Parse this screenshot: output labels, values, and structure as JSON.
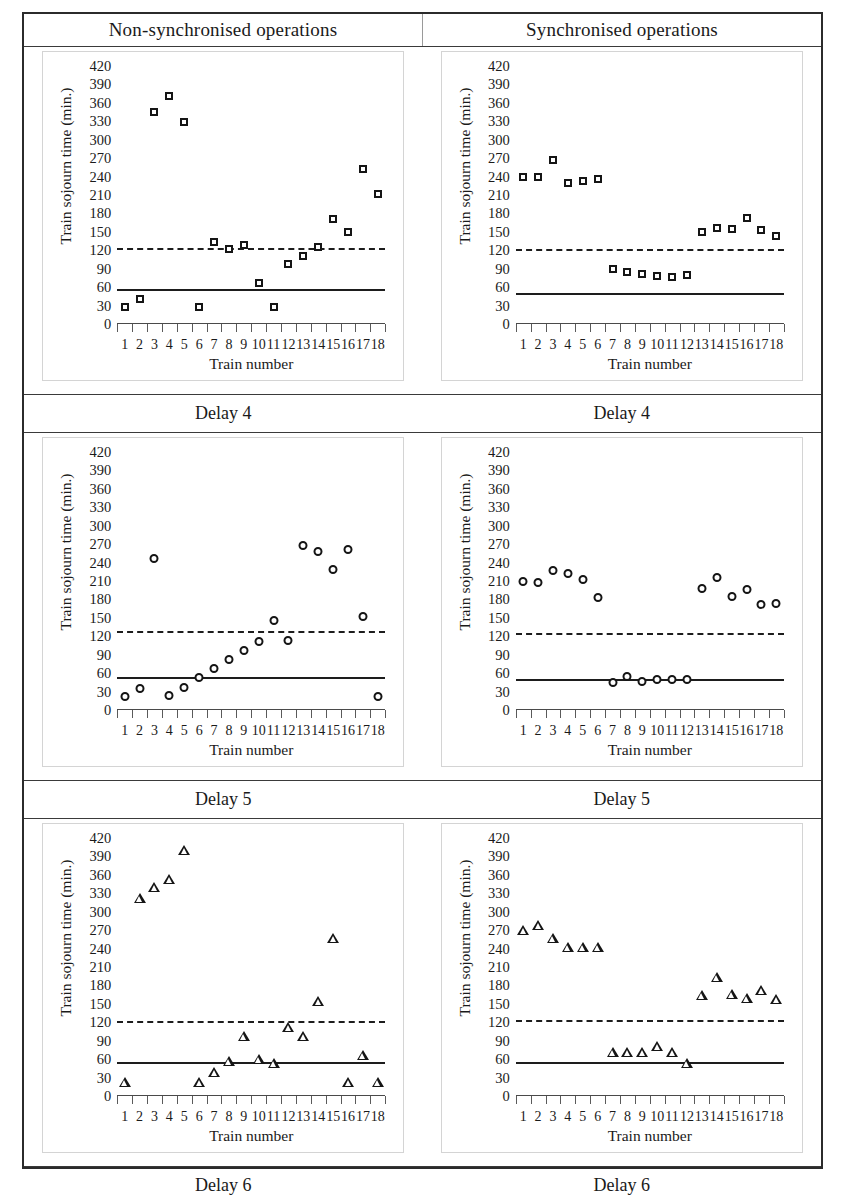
{
  "figure": {
    "column_headers": [
      "Non-synchronised operations",
      "Synchronised operations"
    ],
    "captions": [
      "Delay 4",
      "Delay 5",
      "Delay 6"
    ],
    "axis": {
      "ylabel": "Train sojourn time (min.)",
      "xlabel": "Train number",
      "yticks": [
        420,
        390,
        360,
        330,
        300,
        270,
        240,
        210,
        180,
        150,
        120,
        90,
        60,
        30,
        0
      ],
      "xticks": [
        1,
        2,
        3,
        4,
        5,
        6,
        7,
        8,
        9,
        10,
        11,
        12,
        13,
        14,
        15,
        16,
        17,
        18
      ]
    },
    "colors": {
      "marker_stroke": "#151515",
      "reference_line": "#1d1d1d",
      "axis": "#4a4a4a",
      "table_border": "#2b2b2b",
      "plot_border": "#d4d4d4"
    }
  },
  "chart_data": [
    {
      "type": "scatter",
      "id": "delay4-nonsync",
      "title": "Delay 4",
      "panel": "Non-synchronised operations",
      "marker": "square",
      "xlabel": "Train number",
      "ylabel": "Train sojourn time (min.)",
      "ylim": [
        0,
        420
      ],
      "xlim": [
        0.5,
        18.5
      ],
      "grid": false,
      "x": [
        1,
        2,
        3,
        4,
        5,
        6,
        7,
        8,
        9,
        10,
        11,
        12,
        13,
        14,
        15,
        16,
        17,
        18
      ],
      "values": [
        27,
        40,
        345,
        371,
        329,
        27,
        134,
        122,
        129,
        67,
        27,
        98,
        111,
        126,
        171,
        150,
        252,
        211
      ],
      "reference_lines": [
        {
          "name": "mean",
          "style": "solid",
          "value": 57
        },
        {
          "name": "threshold",
          "style": "dashed",
          "value": 123
        }
      ]
    },
    {
      "type": "scatter",
      "id": "delay4-sync",
      "title": "Delay 4",
      "panel": "Synchronised operations",
      "marker": "square",
      "xlabel": "Train number",
      "ylabel": "Train sojourn time (min.)",
      "ylim": [
        0,
        420
      ],
      "xlim": [
        0.5,
        18.5
      ],
      "grid": false,
      "x": [
        1,
        2,
        3,
        4,
        5,
        6,
        7,
        8,
        9,
        10,
        11,
        12,
        13,
        14,
        15,
        16,
        17,
        18
      ],
      "values": [
        240,
        239,
        267,
        229,
        233,
        236,
        90,
        85,
        81,
        78,
        77,
        80,
        150,
        157,
        155,
        173,
        153,
        143
      ],
      "reference_lines": [
        {
          "name": "mean",
          "style": "solid",
          "value": 51
        },
        {
          "name": "threshold",
          "style": "dashed",
          "value": 122
        }
      ]
    },
    {
      "type": "scatter",
      "id": "delay5-nonsync",
      "title": "Delay 5",
      "panel": "Non-synchronised operations",
      "marker": "circle",
      "xlabel": "Train number",
      "ylabel": "Train sojourn time (min.)",
      "ylim": [
        0,
        420
      ],
      "xlim": [
        0.5,
        18.5
      ],
      "grid": false,
      "x": [
        1,
        2,
        3,
        4,
        5,
        6,
        7,
        8,
        9,
        10,
        11,
        12,
        13,
        14,
        15,
        16,
        17,
        18
      ],
      "values": [
        22,
        36,
        248,
        24,
        37,
        53,
        68,
        83,
        98,
        112,
        146,
        114,
        269,
        259,
        229,
        262,
        153,
        23
      ],
      "reference_lines": [
        {
          "name": "mean",
          "style": "solid",
          "value": 54
        },
        {
          "name": "threshold",
          "style": "dashed",
          "value": 129
        }
      ]
    },
    {
      "type": "scatter",
      "id": "delay5-sync",
      "title": "Delay 5",
      "panel": "Synchronised operations",
      "marker": "circle",
      "xlabel": "Train number",
      "ylabel": "Train sojourn time (min.)",
      "ylim": [
        0,
        420
      ],
      "xlim": [
        0.5,
        18.5
      ],
      "grid": false,
      "x": [
        1,
        2,
        3,
        4,
        5,
        6,
        7,
        8,
        9,
        10,
        11,
        12,
        13,
        14,
        15,
        16,
        17,
        18
      ],
      "values": [
        210,
        209,
        228,
        223,
        214,
        184,
        45,
        56,
        47,
        50,
        50,
        51,
        199,
        217,
        186,
        197,
        173,
        175
      ],
      "reference_lines": [
        {
          "name": "mean",
          "style": "solid",
          "value": 51
        },
        {
          "name": "threshold",
          "style": "dashed",
          "value": 125
        }
      ]
    },
    {
      "type": "scatter",
      "id": "delay6-nonsync",
      "title": "Delay 6",
      "panel": "Non-synchronised operations",
      "marker": "triangle",
      "xlabel": "Train number",
      "ylabel": "Train sojourn time (min.)",
      "ylim": [
        0,
        420
      ],
      "xlim": [
        0.5,
        18.5
      ],
      "grid": false,
      "x": [
        1,
        2,
        3,
        4,
        5,
        6,
        7,
        8,
        9,
        10,
        11,
        12,
        13,
        14,
        15,
        16,
        17,
        18
      ],
      "values": [
        22,
        322,
        341,
        354,
        400,
        23,
        39,
        57,
        98,
        61,
        54,
        113,
        98,
        155,
        257,
        22,
        67,
        22
      ],
      "reference_lines": [
        {
          "name": "mean",
          "style": "solid",
          "value": 55
        },
        {
          "name": "threshold",
          "style": "dashed",
          "value": 122
        }
      ]
    },
    {
      "type": "scatter",
      "id": "delay6-sync",
      "title": "Delay 6",
      "panel": "Synchronised operations",
      "marker": "triangle",
      "xlabel": "Train number",
      "ylabel": "Train sojourn time (min.)",
      "ylim": [
        0,
        420
      ],
      "xlim": [
        0.5,
        18.5
      ],
      "grid": false,
      "x": [
        1,
        2,
        3,
        4,
        5,
        6,
        7,
        8,
        9,
        10,
        11,
        12,
        13,
        14,
        15,
        16,
        17,
        18
      ],
      "values": [
        271,
        279,
        257,
        243,
        243,
        243,
        72,
        72,
        72,
        81,
        72,
        53,
        165,
        194,
        166,
        160,
        172,
        158
      ],
      "reference_lines": [
        {
          "name": "mean",
          "style": "solid",
          "value": 55
        },
        {
          "name": "threshold",
          "style": "dashed",
          "value": 124
        }
      ]
    }
  ]
}
